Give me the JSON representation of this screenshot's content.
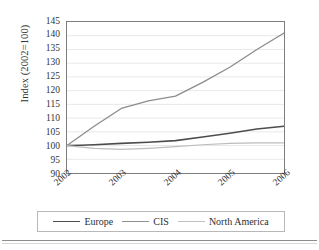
{
  "chart_data": {
    "type": "line",
    "title": "",
    "xlabel": "",
    "ylabel": "Index (2002=100)",
    "ylim": [
      90,
      145
    ],
    "ytick_labels": [
      "145",
      "140",
      "135",
      "130",
      "125",
      "120",
      "115",
      "110",
      "105",
      "100",
      "95",
      "90"
    ],
    "ytick_values": [
      145,
      140,
      135,
      130,
      125,
      120,
      115,
      110,
      105,
      100,
      95,
      90
    ],
    "categories": [
      "2002",
      "2003",
      "2004",
      "2005",
      "2006"
    ],
    "x": [
      2002,
      2003,
      2004,
      2005,
      2006
    ],
    "grid": true,
    "legend_position": "bottom",
    "series": [
      {
        "name": "Europe",
        "color": "#4d4d4d",
        "width": 1.6,
        "values": [
          100.0,
          100.8,
          101.8,
          104.5,
          107.0
        ],
        "dense_x": [
          2002,
          2002.25,
          2002.5,
          2003,
          2003.5,
          2004,
          2004.5,
          2005,
          2005.5,
          2006
        ],
        "dense_values": [
          100.0,
          100.1,
          100.3,
          100.8,
          101.2,
          101.8,
          103.1,
          104.5,
          106.0,
          107.0
        ]
      },
      {
        "name": "CIS",
        "color": "#8c8c8c",
        "width": 1.3,
        "values": [
          100.0,
          113.5,
          118.0,
          128.5,
          141.0
        ],
        "dense_x": [
          2002,
          2002.5,
          2003,
          2003.5,
          2004,
          2004.5,
          2005,
          2005.5,
          2006
        ],
        "dense_values": [
          100.0,
          107.0,
          113.5,
          116.3,
          118.0,
          123.0,
          128.5,
          135.0,
          141.0
        ]
      },
      {
        "name": "North America",
        "color": "#bdbdbd",
        "width": 1.2,
        "values": [
          100.0,
          98.6,
          99.6,
          100.8,
          101.0
        ],
        "dense_x": [
          2002,
          2002.5,
          2003,
          2003.5,
          2004,
          2004.5,
          2005,
          2005.5,
          2006
        ],
        "dense_values": [
          100.0,
          99.0,
          98.6,
          99.0,
          99.6,
          100.3,
          100.8,
          101.0,
          101.0
        ]
      }
    ]
  },
  "legend": {
    "items": [
      {
        "label": "Europe",
        "color": "#4d4d4d",
        "thickness": "1.9px"
      },
      {
        "label": "CIS",
        "color": "#8f8f8f",
        "thickness": "1.5px"
      },
      {
        "label": "North America",
        "color": "#c2c2c2",
        "thickness": "1.2px"
      }
    ]
  },
  "axis": {
    "frame_color": "#7d7d7d",
    "grid_color": "#e2e2e2"
  }
}
